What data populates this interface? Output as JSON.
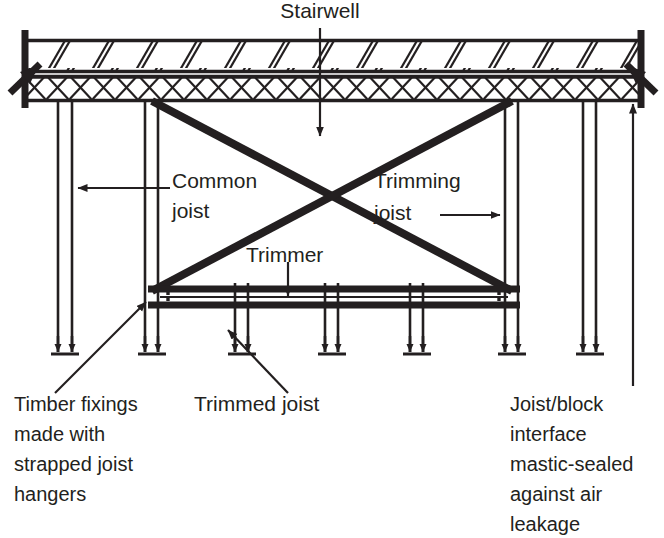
{
  "diagram": {
    "type": "architectural-section",
    "background_color": "#ffffff",
    "line_color": "#231f20",
    "text_color": "#231f20",
    "labels": {
      "stairwell": "Stairwell",
      "common_joist_line1": "Common",
      "common_joist_line2": "joist",
      "trimming_joist_line1": "Trimming",
      "trimming_joist_line2": "joist",
      "trimmer": "Trimmer",
      "trimmed_joist": "Trimmed joist",
      "timber_fixings_line1": "Timber fixings",
      "timber_fixings_line2": "made with",
      "timber_fixings_line3": "strapped joist",
      "timber_fixings_line4": "hangers",
      "joist_block_line1": "Joist/block",
      "joist_block_line2": "interface",
      "joist_block_line3": "mastic-sealed",
      "joist_block_line4": "against air",
      "joist_block_line5": "leakage"
    },
    "elements": {
      "upper_band_name": "screed-diagonal-hatch-band",
      "lower_band_name": "block-cross-hatch-band",
      "cross_brace_name": "stairwell-cross-brace",
      "trimmer_name": "trimmer-beam",
      "break_symbol_name": "wall-break-symbol"
    },
    "geometry": {
      "width": 664,
      "height": 538,
      "upper_band_top": 40,
      "upper_band_bottom": 72,
      "lower_band_top": 76,
      "lower_band_bottom": 100,
      "left_wall_x": 22,
      "right_wall_x": 644,
      "trimmer_top_y": 287,
      "trimmer_bottom_y": 303,
      "joist_bottom_y": 355,
      "common_joist_x": [
        58,
        72,
        145,
        158,
        505,
        518,
        583,
        596
      ],
      "trimmed_joist_x": [
        235,
        248,
        325,
        338,
        410,
        423
      ],
      "cross_left_x": 152,
      "cross_right_x": 512
    }
  }
}
